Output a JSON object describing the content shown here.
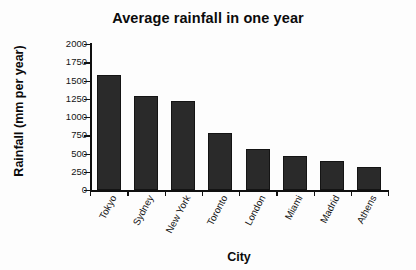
{
  "chart_data": {
    "type": "bar",
    "title": "Average rainfall in one year",
    "xlabel": "City",
    "ylabel": "Rainfall (mm per year)",
    "categories": [
      "Tokyo",
      "Sydney",
      "New York",
      "Toronto",
      "London",
      "Miami",
      "Madrid",
      "Athens"
    ],
    "values": [
      1580,
      1290,
      1220,
      780,
      560,
      465,
      395,
      315
    ],
    "ylim": [
      0,
      2000
    ],
    "ytick_labels": [
      "0",
      "250",
      "500",
      "750",
      "1000",
      "1250",
      "1500",
      "1750",
      "2000"
    ],
    "ytick_values": [
      0,
      250,
      500,
      750,
      1000,
      1250,
      1500,
      1750,
      2000
    ],
    "grid": false,
    "legend": "none",
    "bar_color": "#2a2a2a",
    "axis_color": "#101010",
    "background": "#fdfdfd"
  }
}
